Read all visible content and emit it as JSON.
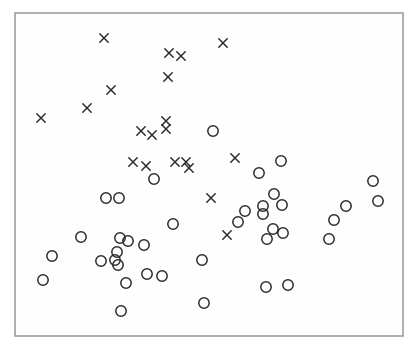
{
  "figure": {
    "width_px": 415,
    "height_px": 350,
    "background_color": "#ffffff",
    "frame": {
      "x": 15,
      "y": 13,
      "width": 388,
      "height": 323,
      "border_color": "#8f8f8f",
      "border_width": 1.4,
      "fill": "#fefefe"
    }
  },
  "chart_data": {
    "type": "scatter",
    "title": "",
    "subtitle": "",
    "xlabel": "",
    "ylabel": "",
    "axes_visible": false,
    "tick_labels_visible": false,
    "grid": false,
    "legend": null,
    "coordinate_space": "image pixels, origin top-left, 415x350",
    "marker_color": "#2b2b2b",
    "marker_stroke_width": 1.5,
    "cross_half_size": 4.2,
    "circle_radius": 5.2,
    "series": [
      {
        "name": "crosses",
        "marker": "x",
        "points": [
          [
            104,
            38
          ],
          [
            223,
            43
          ],
          [
            169,
            53
          ],
          [
            181,
            56
          ],
          [
            168,
            77
          ],
          [
            111,
            90
          ],
          [
            87,
            108
          ],
          [
            41,
            118
          ],
          [
            166,
            121
          ],
          [
            166,
            129
          ],
          [
            141,
            131
          ],
          [
            152,
            135
          ],
          [
            133,
            162
          ],
          [
            146,
            166
          ],
          [
            175,
            162
          ],
          [
            186,
            162
          ],
          [
            189,
            168
          ],
          [
            235,
            158
          ],
          [
            211,
            198
          ],
          [
            227,
            235
          ]
        ]
      },
      {
        "name": "circles",
        "marker": "o",
        "points": [
          [
            213,
            131
          ],
          [
            281,
            161
          ],
          [
            259,
            173
          ],
          [
            154,
            179
          ],
          [
            373,
            181
          ],
          [
            274,
            194
          ],
          [
            106,
            198
          ],
          [
            119,
            198
          ],
          [
            378,
            201
          ],
          [
            346,
            206
          ],
          [
            263,
            206
          ],
          [
            282,
            205
          ],
          [
            245,
            211
          ],
          [
            263,
            214
          ],
          [
            334,
            220
          ],
          [
            238,
            222
          ],
          [
            173,
            224
          ],
          [
            273,
            229
          ],
          [
            283,
            233
          ],
          [
            81,
            237
          ],
          [
            120,
            238
          ],
          [
            267,
            239
          ],
          [
            329,
            239
          ],
          [
            128,
            241
          ],
          [
            144,
            245
          ],
          [
            117,
            252
          ],
          [
            52,
            256
          ],
          [
            101,
            261
          ],
          [
            115,
            260
          ],
          [
            118,
            265
          ],
          [
            202,
            260
          ],
          [
            147,
            274
          ],
          [
            162,
            276
          ],
          [
            43,
            280
          ],
          [
            126,
            283
          ],
          [
            266,
            287
          ],
          [
            288,
            285
          ],
          [
            204,
            303
          ],
          [
            121,
            311
          ]
        ]
      }
    ]
  }
}
